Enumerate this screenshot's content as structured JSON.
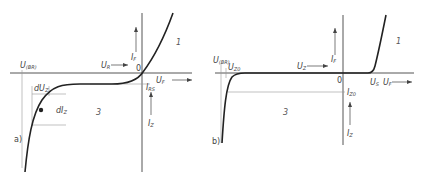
{
  "figure": {
    "panels": [
      {
        "id": "a",
        "panel_label": "a)",
        "labels": {
          "breakdown_voltage": "U",
          "breakdown_voltage_sub": "(BR)",
          "zener_dU": "dU",
          "zener_dU_sub": "Z",
          "zener_dI": "dI",
          "zener_dI_sub": "Z",
          "reverse_voltage": "U",
          "reverse_voltage_sub": "R",
          "forward_current": "I",
          "forward_current_sub": "F",
          "origin": "0",
          "forward_voltage": "U",
          "forward_voltage_sub": "F",
          "reverse_saturation_current": "I",
          "reverse_saturation_current_sub": "RS",
          "reverse_current": "I",
          "reverse_current_sub": "Z",
          "region_forward": "1",
          "region_reverse": "3"
        }
      },
      {
        "id": "b",
        "panel_label": "b)",
        "labels": {
          "breakdown_voltage": "U",
          "breakdown_voltage_sub": "(BR)",
          "zener_voltage": "U",
          "zener_voltage_sub": "Z0",
          "reverse_voltage": "U",
          "reverse_voltage_sub": "Z",
          "forward_current": "I",
          "forward_current_sub": "F",
          "origin": "0",
          "threshold_voltage": "U",
          "threshold_voltage_sub": "S",
          "forward_voltage": "U",
          "forward_voltage_sub": "F",
          "zener_current": "I",
          "zener_current_sub": "Z0",
          "reverse_current": "I",
          "reverse_current_sub": "Z",
          "region_forward": "1",
          "region_reverse": "3"
        }
      }
    ],
    "colors": {
      "curve": "#222222",
      "axis": "#555555",
      "guide": "#888888"
    }
  }
}
